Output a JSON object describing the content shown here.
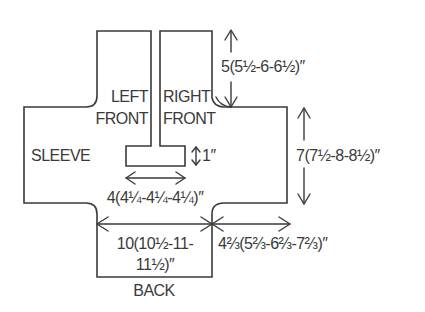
{
  "diagram": {
    "type": "knitting-schematic",
    "pieces": {
      "left_front": {
        "label_line1": "LEFT",
        "label_line2": "FRONT"
      },
      "right_front": {
        "label_line1": "RIGHT",
        "label_line2": "FRONT"
      },
      "sleeve": {
        "label": "SLEEVE"
      },
      "back": {
        "label": "BACK"
      }
    },
    "measurements": {
      "front_length": "5(5½-6-6½)″",
      "sleeve_height": "7(7½-8-8½)″",
      "collar_height": "1″",
      "collar_width": "4(4¼-4¼-4¼)″",
      "back_width_line1": "10(10½-11-",
      "back_width_line2": "11½)″",
      "sleeve_length": "4⅔(5⅔-6⅔-7⅔)″"
    },
    "colors": {
      "line": "#3a3a3a",
      "background": "#ffffff"
    }
  }
}
